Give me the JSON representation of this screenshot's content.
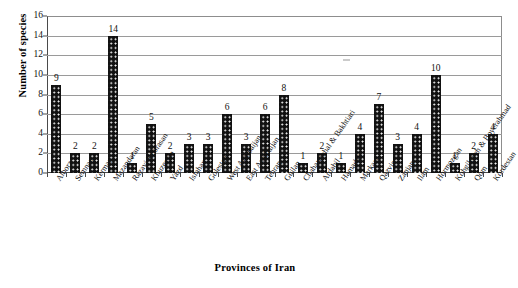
{
  "chart_data": {
    "type": "bar",
    "title": "",
    "subtitle": "",
    "xlabel": "Provinces of Iran",
    "ylabel": "Number of species",
    "ylim": [
      0,
      16
    ],
    "ytick_step": 2,
    "yticks": [
      0,
      2,
      4,
      6,
      8,
      10,
      12,
      14,
      16
    ],
    "grid": true,
    "legend": null,
    "legend_position": "none",
    "data_labels": true,
    "bar_color": "#111111",
    "bar_pattern": "dotted-fill",
    "categories": [
      "Alborz",
      "Semnan",
      "Kerman",
      "Mazandaran",
      "Razavi Khorasan",
      "Khuzestan",
      "Yazd",
      "Isfahan",
      "Golestan",
      "West Azarbaijan",
      "East Azarbaijan",
      "Tehran",
      "Guilan",
      "Chaharmahal & Bakhtiari",
      "Ardabil",
      "Hamadan",
      "Markazi",
      "Qazvin",
      "Zanjan",
      "Ilam",
      "Hormozgan",
      "Kohgiloyeh & Boyerahmad",
      "Qom",
      "Kordestan"
    ],
    "values": [
      9,
      2,
      2,
      14,
      1,
      5,
      2,
      3,
      3,
      6,
      3,
      6,
      8,
      1,
      2,
      1,
      4,
      7,
      3,
      4,
      10,
      1,
      2,
      4
    ]
  }
}
